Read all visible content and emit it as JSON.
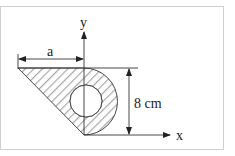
{
  "figure": {
    "axes": {
      "x_label": "x",
      "y_label": "y"
    },
    "dimensions": {
      "width_label": "a",
      "height_label": "8 cm"
    },
    "shape": {
      "description": "Hatched area composed of a right triangle on the left of the y-axis and a semicircle on the right, with a circular hole centered on the y-axis",
      "components": [
        "triangle",
        "semicircle",
        "circular-hole"
      ]
    },
    "colors": {
      "frame": "#d0d0d0",
      "line": "#333333",
      "hatch": "#a8a8a8"
    }
  }
}
